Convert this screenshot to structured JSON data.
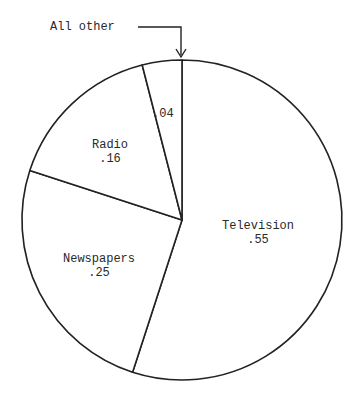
{
  "chart_data": {
    "type": "pie",
    "title": "",
    "start_angle_deg": 0,
    "direction": "clockwise",
    "slices": [
      {
        "label": "Television",
        "value": 0.55,
        "value_label": ".55"
      },
      {
        "label": "Newspapers",
        "value": 0.25,
        "value_label": ".25"
      },
      {
        "label": "Radio",
        "value": 0.16,
        "value_label": ".16"
      },
      {
        "label": "All other",
        "value": 0.04,
        "value_label": ".04"
      }
    ],
    "annotations": [
      {
        "text": "All other",
        "type": "arrow-callout",
        "target_slice": "All other"
      }
    ],
    "colors": {
      "stroke": "#222222",
      "fill": "#ffffff",
      "text": "#2a2a2a"
    }
  },
  "labels": {
    "television": {
      "name": "Television",
      "value": ".55"
    },
    "newspapers": {
      "name": "Newspapers",
      "value": ".25"
    },
    "radio": {
      "name": "Radio",
      "value": ".16"
    },
    "all_other": {
      "value": ".04"
    },
    "callout": "All other"
  }
}
